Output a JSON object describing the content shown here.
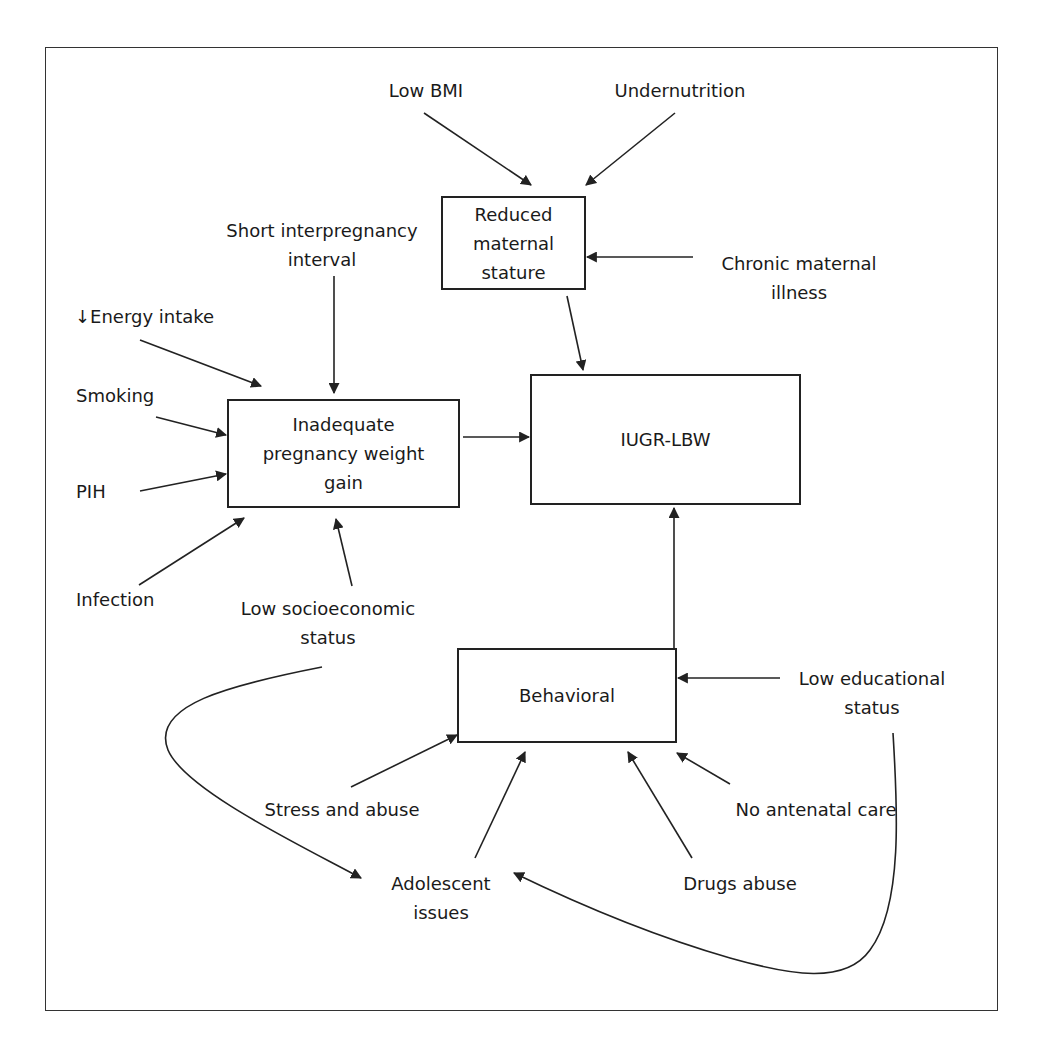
{
  "diagram": {
    "boxes": {
      "reduced_stature": {
        "line1": "Reduced",
        "line2": "maternal",
        "line3": "stature"
      },
      "inadequate_gain": {
        "line1": "Inadequate",
        "line2": "pregnancy weight",
        "line3": "gain"
      },
      "outcome": {
        "label": "IUGR-LBW"
      },
      "behavioral": {
        "label": "Behavioral"
      }
    },
    "factors": {
      "low_bmi": {
        "label": "Low BMI"
      },
      "undernutrition": {
        "label": "Undernutrition"
      },
      "chronic_illness": {
        "line1": "Chronic maternal",
        "line2": "illness"
      },
      "short_interval": {
        "line1": "Short interpregnancy",
        "line2": "interval"
      },
      "energy_intake": {
        "label": "↓Energy intake"
      },
      "smoking": {
        "label": "Smoking"
      },
      "pih": {
        "label": "PIH"
      },
      "infection": {
        "label": "Infection"
      },
      "low_ses": {
        "line1": "Low socioeconomic",
        "line2": "status"
      },
      "low_education": {
        "line1": "Low educational",
        "line2": "status"
      },
      "stress_abuse": {
        "label": "Stress and abuse"
      },
      "no_antenatal": {
        "label": "No antenatal care"
      },
      "adolescent": {
        "line1": "Adolescent",
        "line2": "issues"
      },
      "drugs": {
        "label": "Drugs abuse"
      }
    },
    "edges": [
      {
        "from": "Low BMI",
        "to": "Reduced maternal stature"
      },
      {
        "from": "Undernutrition",
        "to": "Reduced maternal stature"
      },
      {
        "from": "Chronic maternal illness",
        "to": "Reduced maternal stature"
      },
      {
        "from": "Reduced maternal stature",
        "to": "IUGR-LBW"
      },
      {
        "from": "Short interpregnancy interval",
        "to": "Inadequate pregnancy weight gain"
      },
      {
        "from": "Energy intake",
        "to": "Inadequate pregnancy weight gain"
      },
      {
        "from": "Smoking",
        "to": "Inadequate pregnancy weight gain"
      },
      {
        "from": "PIH",
        "to": "Inadequate pregnancy weight gain"
      },
      {
        "from": "Infection",
        "to": "Inadequate pregnancy weight gain"
      },
      {
        "from": "Low socioeconomic status",
        "to": "Inadequate pregnancy weight gain"
      },
      {
        "from": "Inadequate pregnancy weight gain",
        "to": "IUGR-LBW"
      },
      {
        "from": "Behavioral",
        "to": "IUGR-LBW"
      },
      {
        "from": "Low educational status",
        "to": "Behavioral"
      },
      {
        "from": "Stress and abuse",
        "to": "Behavioral"
      },
      {
        "from": "Adolescent issues",
        "to": "Behavioral"
      },
      {
        "from": "Drugs abuse",
        "to": "Behavioral"
      },
      {
        "from": "No antenatal care",
        "to": "Behavioral"
      },
      {
        "from": "Low socioeconomic status",
        "to": "Adolescent issues"
      },
      {
        "from": "Low educational status",
        "to": "Adolescent issues"
      }
    ],
    "colors": {
      "stroke": "#222222",
      "background": "#ffffff"
    }
  }
}
